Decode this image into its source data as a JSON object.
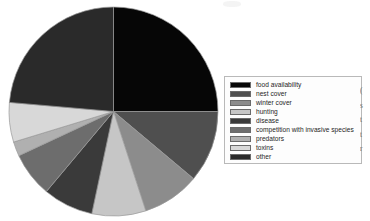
{
  "chart_data": {
    "type": "pie",
    "title": "",
    "legend_position": "right",
    "start_angle_deg": 0,
    "direction": "clockwise",
    "categories": [
      "food availability",
      "nest cover",
      "winter cover",
      "hunting",
      "disease",
      "competition with invasive species",
      "predators",
      "toxins",
      "other"
    ],
    "values": [
      25.0,
      11.1,
      8.9,
      8.3,
      7.8,
      6.9,
      2.2,
      6.1,
      23.7
    ],
    "angles_deg": [
      90.0,
      40.0,
      32.0,
      30.0,
      28.0,
      25.0,
      8.0,
      22.0,
      85.0
    ],
    "colors": [
      "#060606",
      "#4f4f4f",
      "#8c8c8c",
      "#c6c6c6",
      "#3a3a3a",
      "#6d6d6d",
      "#b0b0b0",
      "#d8d8d8",
      "#2a2a2a"
    ],
    "xlabel": "",
    "ylabel": ""
  },
  "legend": {
    "items": [
      {
        "label": "food availability",
        "color": "#060606"
      },
      {
        "label": "nest cover",
        "color": "#4f4f4f"
      },
      {
        "label": "winter cover",
        "color": "#8c8c8c"
      },
      {
        "label": "hunting",
        "color": "#c6c6c6"
      },
      {
        "label": "disease",
        "color": "#3a3a3a"
      },
      {
        "label": "competition with invasive species",
        "color": "#6d6d6d"
      },
      {
        "label": "predators",
        "color": "#b0b0b0"
      },
      {
        "label": "toxins",
        "color": "#d8d8d8"
      },
      {
        "label": "other",
        "color": "#2a2a2a"
      }
    ]
  },
  "edge_text": {
    "lines": [
      "(",
      "s",
      "t",
      "t",
      "r"
    ]
  }
}
